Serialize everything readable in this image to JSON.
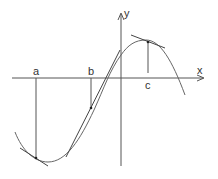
{
  "diagram": {
    "title": "",
    "axes": {
      "x_label": "x",
      "y_label": "y"
    },
    "points": [
      {
        "label": "a",
        "description": "local minimum region, tangent drawn"
      },
      {
        "label": "b",
        "description": "inflection region, tangent drawn"
      },
      {
        "label": "c",
        "description": "local maximum, horizontal-ish tangent drawn"
      }
    ],
    "colors": {
      "curve": "#555555",
      "axes": "#555555",
      "background": "#ffffff"
    }
  }
}
